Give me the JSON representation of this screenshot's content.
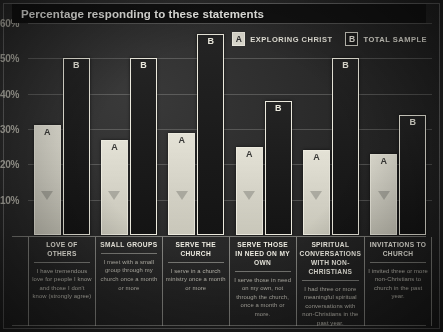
{
  "header": {
    "title": "Percentage responding to these statements"
  },
  "legend": {
    "items": [
      {
        "key": "A",
        "label": "EXPLORING CHRIST",
        "swatch": "#d9d7cc"
      },
      {
        "key": "B",
        "label": "TOTAL SAMPLE",
        "swatch": "#1d1d1d"
      }
    ]
  },
  "colors": {
    "background": "#2a2a2a",
    "panel": "#121212",
    "bar_a": "#d9d7cc",
    "bar_b": "#1a1a1a",
    "bar_outline": "#eceade",
    "text": "#f0eee4",
    "muted_text": "#bdbbb1",
    "gridline": "#bebeb9"
  },
  "chart_data": {
    "type": "bar",
    "title": "Percentage responding to these statements",
    "xlabel": "",
    "ylabel": "",
    "ylim": [
      0,
      60
    ],
    "yticks": [
      60,
      50,
      40,
      30,
      20,
      10
    ],
    "ytick_labels": [
      "60%",
      "50%",
      "40%",
      "30%",
      "20%",
      "10%"
    ],
    "grid": true,
    "legend_position": "top-right",
    "categories": [
      "LOVE OF OTHERS",
      "SMALL GROUPS",
      "SERVE THE CHURCH",
      "SERVE THOSE IN NEED ON MY OWN",
      "SPIRITUAL CONVERSATIONS WITH NON-CHRISTIANS",
      "INVITATIONS TO CHURCH"
    ],
    "series": [
      {
        "name": "EXPLORING CHRIST",
        "key": "A",
        "values": [
          31,
          27,
          29,
          25,
          24,
          23
        ]
      },
      {
        "name": "TOTAL SAMPLE",
        "key": "B",
        "values": [
          50,
          50,
          57,
          38,
          50,
          34
        ]
      }
    ]
  },
  "categories": [
    {
      "title": "LOVE OF OTHERS",
      "description": "I have tremendous love for people I know and those I don't know (strongly agree)",
      "a": 31,
      "b": 50
    },
    {
      "title": "SMALL GROUPS",
      "description": "I meet with a small group through my church once a month or more",
      "a": 27,
      "b": 50
    },
    {
      "title": "SERVE THE CHURCH",
      "description": "I serve in a church ministry once a month or more",
      "a": 29,
      "b": 57
    },
    {
      "title": "SERVE THOSE IN NEED ON MY OWN",
      "description": "I serve those in need on my own, not through the church, once a month or more.",
      "a": 25,
      "b": 38
    },
    {
      "title": "SPIRITUAL CONVERSATIONS WITH NON-CHRISTIANS",
      "description": "I had three or more meaningful spiritual conversations with non-Christians in the past year.",
      "a": 24,
      "b": 50
    },
    {
      "title": "INVITATIONS TO CHURCH",
      "description": "I invited three or more non-Christians to church in the past year.",
      "a": 23,
      "b": 34
    }
  ]
}
